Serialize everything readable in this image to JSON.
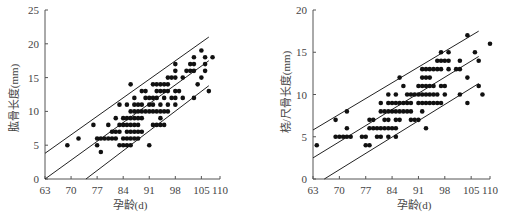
{
  "chart_data": [
    {
      "type": "scatter",
      "title": "",
      "xlabel": "孕龄(d)",
      "ylabel": "肱骨长度(mm)",
      "xlim": [
        63,
        110
      ],
      "ylim": [
        0,
        25
      ],
      "x_ticks": [
        63,
        70,
        77,
        84,
        91,
        98,
        105,
        110
      ],
      "y_ticks": [
        0,
        5,
        10,
        15,
        20,
        25
      ],
      "grid": false,
      "legend": null,
      "lines": [
        {
          "name": "upper",
          "x": [
            63,
            107
          ],
          "y": [
            3.8,
            21
          ]
        },
        {
          "name": "mean",
          "x": [
            63,
            107
          ],
          "y": [
            0,
            17.5
          ]
        },
        {
          "name": "lower",
          "x": [
            74,
            107
          ],
          "y": [
            0,
            13.8
          ]
        }
      ],
      "points": [
        [
          69,
          5
        ],
        [
          72,
          6
        ],
        [
          76,
          8
        ],
        [
          77,
          5
        ],
        [
          77,
          6
        ],
        [
          78,
          4
        ],
        [
          78,
          6
        ],
        [
          79,
          6
        ],
        [
          80,
          6
        ],
        [
          80,
          8
        ],
        [
          81,
          6
        ],
        [
          81,
          7
        ],
        [
          82,
          6
        ],
        [
          82,
          7
        ],
        [
          82,
          9
        ],
        [
          83,
          5
        ],
        [
          83,
          7
        ],
        [
          83,
          8
        ],
        [
          83,
          11
        ],
        [
          84,
          5
        ],
        [
          84,
          6
        ],
        [
          84,
          8
        ],
        [
          84,
          9
        ],
        [
          85,
          5
        ],
        [
          85,
          6
        ],
        [
          85,
          7
        ],
        [
          85,
          8
        ],
        [
          85,
          9
        ],
        [
          85,
          11
        ],
        [
          86,
          5
        ],
        [
          86,
          6
        ],
        [
          86,
          7
        ],
        [
          86,
          8
        ],
        [
          86,
          9
        ],
        [
          86,
          10
        ],
        [
          86,
          14
        ],
        [
          87,
          6
        ],
        [
          87,
          7
        ],
        [
          87,
          8
        ],
        [
          87,
          9
        ],
        [
          87,
          10
        ],
        [
          87,
          11
        ],
        [
          87,
          12
        ],
        [
          88,
          6
        ],
        [
          88,
          7
        ],
        [
          88,
          8
        ],
        [
          88,
          9
        ],
        [
          88,
          10
        ],
        [
          88,
          11
        ],
        [
          89,
          7
        ],
        [
          89,
          9
        ],
        [
          89,
          10
        ],
        [
          89,
          11
        ],
        [
          89,
          13
        ],
        [
          90,
          10
        ],
        [
          90,
          12
        ],
        [
          90,
          13
        ],
        [
          91,
          5
        ],
        [
          91,
          10
        ],
        [
          91,
          11
        ],
        [
          91,
          12
        ],
        [
          92,
          8
        ],
        [
          92,
          10
        ],
        [
          92,
          11
        ],
        [
          92,
          12
        ],
        [
          92,
          14
        ],
        [
          93,
          8
        ],
        [
          93,
          10
        ],
        [
          93,
          12
        ],
        [
          93,
          13
        ],
        [
          93,
          14
        ],
        [
          94,
          8
        ],
        [
          94,
          9
        ],
        [
          94,
          10
        ],
        [
          94,
          11
        ],
        [
          94,
          13
        ],
        [
          94,
          14
        ],
        [
          95,
          8
        ],
        [
          95,
          10
        ],
        [
          95,
          12
        ],
        [
          95,
          13
        ],
        [
          95,
          14
        ],
        [
          96,
          10
        ],
        [
          96,
          11
        ],
        [
          96,
          13
        ],
        [
          96,
          14
        ],
        [
          96,
          15
        ],
        [
          97,
          12
        ],
        [
          97,
          15
        ],
        [
          98,
          11
        ],
        [
          98,
          12
        ],
        [
          98,
          13
        ],
        [
          98,
          15
        ],
        [
          98,
          16
        ],
        [
          98,
          17
        ],
        [
          99,
          13
        ],
        [
          100,
          12
        ],
        [
          100,
          15
        ],
        [
          101,
          16
        ],
        [
          102,
          16
        ],
        [
          102,
          17
        ],
        [
          103,
          12
        ],
        [
          103,
          16
        ],
        [
          103,
          17
        ],
        [
          103,
          18
        ],
        [
          104,
          14
        ],
        [
          105,
          15
        ],
        [
          105,
          19
        ],
        [
          106,
          16
        ],
        [
          106,
          17
        ],
        [
          106,
          18
        ],
        [
          107,
          13
        ],
        [
          108,
          18
        ]
      ]
    },
    {
      "type": "scatter",
      "title": "",
      "xlabel": "孕龄(d)",
      "ylabel": "桡/尺骨长度(mm)",
      "xlim": [
        63,
        110
      ],
      "ylim": [
        0,
        20
      ],
      "x_ticks": [
        63,
        70,
        77,
        84,
        91,
        98,
        105,
        110
      ],
      "y_ticks": [
        0,
        5,
        10,
        15,
        20
      ],
      "grid": false,
      "legend": null,
      "lines": [
        {
          "name": "upper",
          "x": [
            63,
            107
          ],
          "y": [
            5.8,
            17.5
          ]
        },
        {
          "name": "mean",
          "x": [
            63,
            107
          ],
          "y": [
            2.5,
            14.5
          ]
        },
        {
          "name": "lower",
          "x": [
            66,
            107
          ],
          "y": [
            0,
            11.3
          ]
        }
      ],
      "points": [
        [
          64,
          4
        ],
        [
          69,
          5
        ],
        [
          69,
          7
        ],
        [
          70,
          5
        ],
        [
          71,
          5
        ],
        [
          72,
          5
        ],
        [
          72,
          6
        ],
        [
          72,
          8
        ],
        [
          73,
          5
        ],
        [
          76,
          5
        ],
        [
          77,
          4
        ],
        [
          77,
          5
        ],
        [
          78,
          4
        ],
        [
          78,
          6
        ],
        [
          78,
          7
        ],
        [
          79,
          6
        ],
        [
          79,
          7
        ],
        [
          80,
          5
        ],
        [
          80,
          6
        ],
        [
          81,
          5
        ],
        [
          81,
          6
        ],
        [
          81,
          8
        ],
        [
          81,
          9
        ],
        [
          82,
          6
        ],
        [
          82,
          7
        ],
        [
          82,
          8
        ],
        [
          83,
          5
        ],
        [
          83,
          6
        ],
        [
          83,
          7
        ],
        [
          83,
          8
        ],
        [
          83,
          9
        ],
        [
          83,
          10
        ],
        [
          84,
          6
        ],
        [
          84,
          8
        ],
        [
          84,
          9
        ],
        [
          85,
          5
        ],
        [
          85,
          6
        ],
        [
          85,
          7
        ],
        [
          85,
          8
        ],
        [
          85,
          9
        ],
        [
          85,
          10
        ],
        [
          86,
          7
        ],
        [
          86,
          8
        ],
        [
          86,
          9
        ],
        [
          86,
          12
        ],
        [
          87,
          8
        ],
        [
          87,
          9
        ],
        [
          87,
          11
        ],
        [
          88,
          8
        ],
        [
          88,
          9
        ],
        [
          88,
          10
        ],
        [
          89,
          7
        ],
        [
          89,
          8
        ],
        [
          89,
          9
        ],
        [
          89,
          10
        ],
        [
          90,
          7
        ],
        [
          90,
          10
        ],
        [
          91,
          7
        ],
        [
          91,
          9
        ],
        [
          91,
          10
        ],
        [
          91,
          11
        ],
        [
          92,
          8
        ],
        [
          92,
          9
        ],
        [
          92,
          10
        ],
        [
          92,
          11
        ],
        [
          92,
          12
        ],
        [
          92,
          13
        ],
        [
          93,
          6
        ],
        [
          93,
          9
        ],
        [
          93,
          10
        ],
        [
          93,
          11
        ],
        [
          93,
          12
        ],
        [
          93,
          13
        ],
        [
          94,
          9
        ],
        [
          94,
          10
        ],
        [
          94,
          11
        ],
        [
          94,
          12
        ],
        [
          94,
          13
        ],
        [
          95,
          9
        ],
        [
          95,
          10
        ],
        [
          95,
          11
        ],
        [
          95,
          13
        ],
        [
          96,
          9
        ],
        [
          96,
          10
        ],
        [
          96,
          13
        ],
        [
          96,
          14
        ],
        [
          97,
          9
        ],
        [
          97,
          11
        ],
        [
          97,
          13
        ],
        [
          97,
          14
        ],
        [
          97,
          15
        ],
        [
          98,
          10
        ],
        [
          98,
          11
        ],
        [
          98,
          14
        ],
        [
          99,
          13
        ],
        [
          99,
          14
        ],
        [
          99,
          15
        ],
        [
          101,
          13
        ],
        [
          102,
          10
        ],
        [
          102,
          13
        ],
        [
          102,
          14
        ],
        [
          104,
          9
        ],
        [
          104,
          12
        ],
        [
          104,
          17
        ],
        [
          106,
          15
        ],
        [
          107,
          11
        ],
        [
          107,
          14
        ],
        [
          108,
          10
        ],
        [
          110,
          16
        ]
      ]
    }
  ],
  "charts": {
    "left": {
      "ylabel": "肱骨长度(mm)",
      "xlabel": "孕龄(d)",
      "x_ticks": [
        "63",
        "70",
        "77",
        "84",
        "91",
        "98",
        "105",
        "110"
      ],
      "y_ticks": [
        "0",
        "5",
        "10",
        "15",
        "20",
        "25"
      ]
    },
    "right": {
      "ylabel": "桡/尺骨长度(mm)",
      "xlabel": "孕龄(d)",
      "x_ticks": [
        "63",
        "70",
        "77",
        "84",
        "91",
        "98",
        "105",
        "110"
      ],
      "y_ticks": [
        "0",
        "5",
        "10",
        "15",
        "20"
      ]
    }
  },
  "colors": {
    "axis": "#555555",
    "points": "#111111",
    "lines": "#222222",
    "text": "#444444"
  }
}
